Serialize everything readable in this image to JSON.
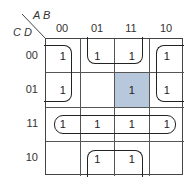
{
  "kmap": {
    "col_var": "A B",
    "row_var": "C D",
    "col_labels": [
      "00",
      "01",
      "11",
      "10"
    ],
    "row_labels": [
      "00",
      "01",
      "11",
      "10"
    ],
    "cells": [
      [
        "1",
        "1",
        "1",
        "1"
      ],
      [
        "1",
        "",
        "1",
        "1"
      ],
      [
        "1",
        "1",
        "1",
        "1"
      ],
      [
        "",
        "1",
        "1",
        ""
      ]
    ],
    "shaded_cell": {
      "row": 1,
      "col": 2
    },
    "shade_color": "#b8c8dc",
    "groups": [
      "corners (00,00)-(00,10)-(01,00)-(01,10)",
      "row 11 quad",
      "AB=01/11 with CD=00 and CD=10 wrap"
    ]
  }
}
